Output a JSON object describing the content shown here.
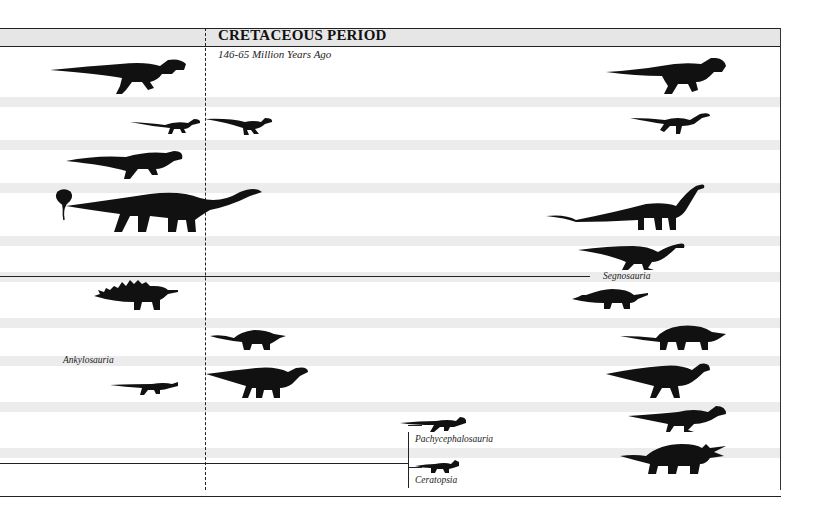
{
  "header": {
    "title": "CRETACEOUS PERIOD",
    "subtitle": "146-65 Million Years Ago"
  },
  "labels": {
    "segnosauria": "Segnosauria",
    "ankylosauria": "Ankylosauria",
    "pachycephalosauria": "Pachycephalosauria",
    "ceratopsia": "Ceratopsia"
  },
  "silhouettes": [
    {
      "name": "large-theropod-left",
      "type": "theropod"
    },
    {
      "name": "large-theropod-right",
      "type": "tyrannosaur"
    },
    {
      "name": "small-theropod-left",
      "type": "small-theropod"
    },
    {
      "name": "small-theropod-mid",
      "type": "raptor"
    },
    {
      "name": "ornithomimid-right",
      "type": "ornithomimid"
    },
    {
      "name": "medium-theropod-left",
      "type": "theropod"
    },
    {
      "name": "sauropod-left",
      "type": "sauropod"
    },
    {
      "name": "sauropod-right",
      "type": "sauropod"
    },
    {
      "name": "segnosaur-right",
      "type": "segnosaur"
    },
    {
      "name": "stegosaur-left",
      "type": "stegosaur"
    },
    {
      "name": "stegosaur-right",
      "type": "stegosaur"
    },
    {
      "name": "nodosaur-mid",
      "type": "ankylosaur"
    },
    {
      "name": "ankylosaur-right",
      "type": "ankylosaur"
    },
    {
      "name": "small-ornithopod-left",
      "type": "ornithopod"
    },
    {
      "name": "iguanodont-mid",
      "type": "iguanodont"
    },
    {
      "name": "hadrosaur-right",
      "type": "hadrosaur"
    },
    {
      "name": "pachycephalosaur-mid",
      "type": "pachycephalosaur"
    },
    {
      "name": "pachycephalosaur-right",
      "type": "pachycephalosaur"
    },
    {
      "name": "protoceratops-mid",
      "type": "ceratopsian"
    },
    {
      "name": "triceratops-right",
      "type": "ceratopsian"
    }
  ]
}
